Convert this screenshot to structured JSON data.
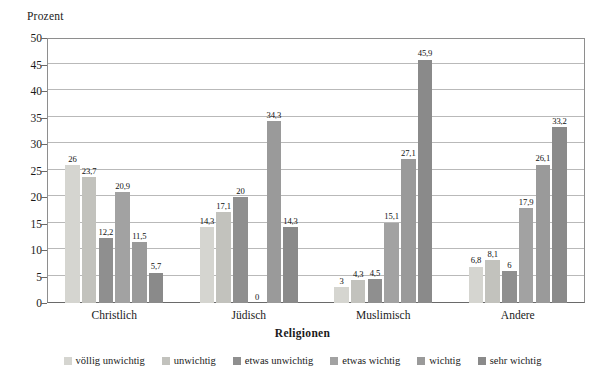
{
  "chart_data": {
    "type": "bar",
    "title": "",
    "xlabel": "Religionen",
    "ylabel": "Prozent",
    "ylim": [
      0,
      50
    ],
    "yticks": [
      0,
      5,
      10,
      15,
      20,
      25,
      30,
      35,
      40,
      45,
      50
    ],
    "ytick_labels": [
      "0",
      "5",
      "10",
      "15",
      "20",
      "25",
      "30",
      "35",
      "40",
      "45",
      "50"
    ],
    "grid": true,
    "legend_position": "bottom",
    "categories": [
      "Christlich",
      "Jüdisch",
      "Muslimisch",
      "Andere"
    ],
    "series": [
      {
        "name": "völlig unwichtig",
        "color": "#d5d5d0",
        "values": [
          26,
          14.3,
          3,
          6.8
        ],
        "labels": [
          "26",
          "14,3",
          "3",
          "6,8"
        ]
      },
      {
        "name": "unwichtig",
        "color": "#c2c2bd",
        "values": [
          23.7,
          17.1,
          4.3,
          8.1
        ],
        "labels": [
          "23,7",
          "17,1",
          "4,3",
          "8,1"
        ]
      },
      {
        "name": "etwas unwichtig",
        "color": "#8f8f8f",
        "values": [
          12.2,
          20,
          4.5,
          6
        ],
        "labels": [
          "12,2",
          "20",
          "4,5",
          "6"
        ]
      },
      {
        "name": "etwas wichtig",
        "color": "#a2a2a2",
        "values": [
          20.9,
          0,
          15.1,
          17.9
        ],
        "labels": [
          "20,9",
          "0",
          "15,1",
          "17,9"
        ]
      },
      {
        "name": "wichtig",
        "color": "#9a9a9a",
        "values": [
          11.5,
          34.3,
          27.1,
          26.1
        ],
        "labels": [
          "11,5",
          "34,3",
          "27,1",
          "26,1"
        ]
      },
      {
        "name": "sehr wichtig",
        "color": "#8a8a8a",
        "values": [
          5.7,
          14.3,
          45.9,
          33.2
        ],
        "labels": [
          "5,7",
          "14,3",
          "45,9",
          "33,2"
        ]
      }
    ]
  }
}
